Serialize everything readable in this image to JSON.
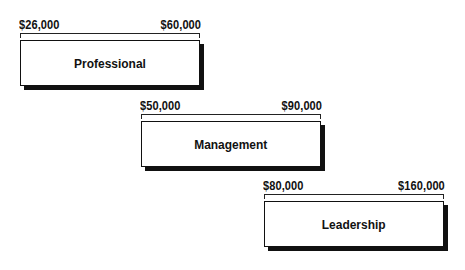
{
  "diagram": {
    "type": "salary-band-staircase",
    "bands": [
      {
        "label": "Professional",
        "min": "$26,000",
        "max": "$60,000"
      },
      {
        "label": "Management",
        "min": "$50,000",
        "max": "$90,000"
      },
      {
        "label": "Leadership",
        "min": "$80,000",
        "max": "$160,000"
      }
    ],
    "colors": {
      "stroke": "#111111",
      "fill": "#ffffff",
      "shadow": "#111111"
    }
  }
}
